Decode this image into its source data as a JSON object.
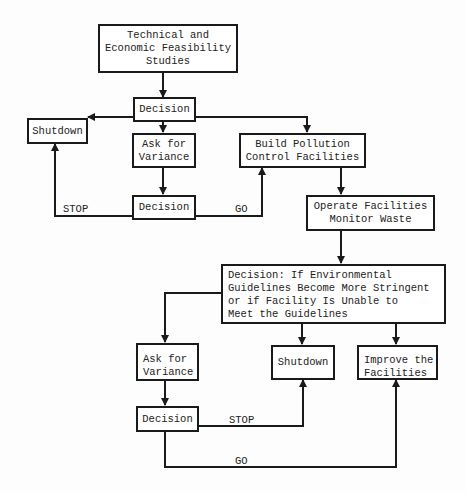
{
  "diagram": {
    "nodes": {
      "feasibility": "Technical and\nEconomic Feasibility\nStudies",
      "decision1": "Decision",
      "shutdown1": "Shutdown",
      "variance1": "Ask for\nVariance",
      "build": "Build Pollution\nControl Facilities",
      "decision2": "Decision",
      "operate": "Operate Facilities\nMonitor Waste",
      "decision_env": "Decision:  If Environmental\nGuidelines Become More Stringent\nor if Facility Is Unable to\nMeet the Guidelines",
      "variance2": "Ask for\nVariance",
      "shutdown2": "Shutdown",
      "improve": "Improve the\nFacilities",
      "decision3": "Decision"
    },
    "edge_labels": {
      "stop1": "STOP",
      "go1": "GO",
      "stop2": "STOP",
      "go2": "GO"
    },
    "edges": [
      {
        "from": "feasibility",
        "to": "decision1"
      },
      {
        "from": "decision1",
        "to": "shutdown1"
      },
      {
        "from": "decision1",
        "to": "variance1"
      },
      {
        "from": "decision1",
        "to": "build"
      },
      {
        "from": "variance1",
        "to": "decision2"
      },
      {
        "from": "decision2",
        "to": "shutdown1",
        "label": "STOP"
      },
      {
        "from": "decision2",
        "to": "build",
        "label": "GO"
      },
      {
        "from": "build",
        "to": "operate"
      },
      {
        "from": "operate",
        "to": "decision_env"
      },
      {
        "from": "decision_env",
        "to": "variance2"
      },
      {
        "from": "decision_env",
        "to": "shutdown2"
      },
      {
        "from": "decision_env",
        "to": "improve"
      },
      {
        "from": "variance2",
        "to": "decision3"
      },
      {
        "from": "decision3",
        "to": "shutdown2",
        "label": "STOP"
      },
      {
        "from": "decision3",
        "to": "improve",
        "label": "GO"
      }
    ]
  }
}
